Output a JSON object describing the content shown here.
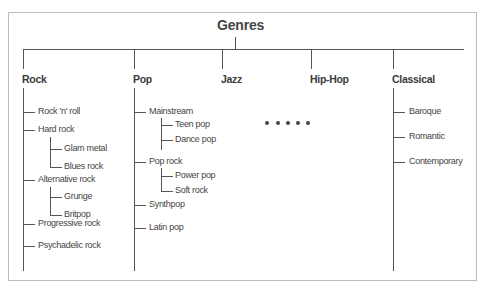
{
  "diagram": {
    "title": "Genres",
    "genres": [
      {
        "name": "Rock",
        "children": [
          {
            "name": "Rock 'n' roll",
            "children": []
          },
          {
            "name": "Hard rock",
            "children": [
              "Glam metal",
              "Blues rock"
            ]
          },
          {
            "name": "Alternative rock",
            "children": [
              "Grunge",
              "Britpop"
            ]
          },
          {
            "name": "Progressive rock",
            "children": []
          },
          {
            "name": "Psychadelic rock",
            "children": []
          }
        ]
      },
      {
        "name": "Pop",
        "children": [
          {
            "name": "Mainstream",
            "children": [
              "Teen pop",
              "Dance pop"
            ]
          },
          {
            "name": "Pop rock",
            "children": [
              "Power pop",
              "Soft rock"
            ]
          },
          {
            "name": "Synthpop",
            "children": []
          },
          {
            "name": "Latin pop",
            "children": []
          }
        ]
      },
      {
        "name": "Jazz",
        "children": []
      },
      {
        "name": "Hip-Hop",
        "children": []
      },
      {
        "name": "Classical",
        "children": [
          {
            "name": "Baroque",
            "children": []
          },
          {
            "name": "Romantic",
            "children": []
          },
          {
            "name": "Contemporary",
            "children": []
          }
        ]
      }
    ],
    "ellipsis": "• • • • •",
    "colors": {
      "line": "#555555",
      "frame": "#bdbdbd",
      "text": "#444444"
    }
  }
}
